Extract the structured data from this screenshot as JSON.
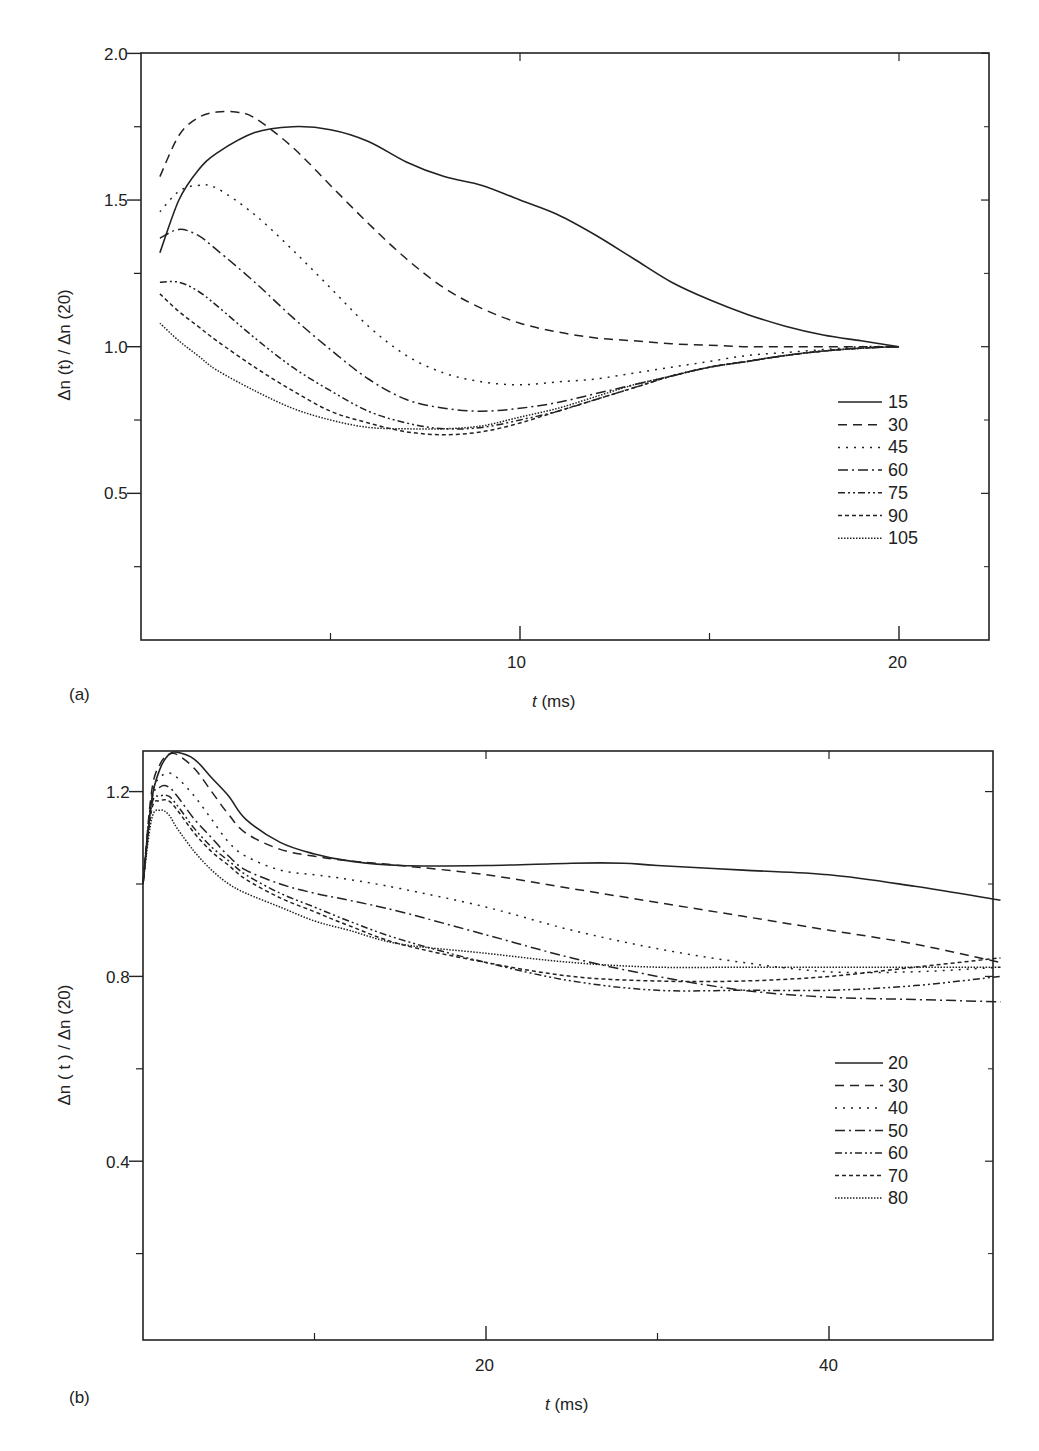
{
  "chart_data": [
    {
      "panel": "(a)",
      "type": "line",
      "xlabel": "t (ms)",
      "ylabel": "Δn (t) / Δn (20)",
      "xlim": [
        0,
        22.5
      ],
      "ylim": [
        0,
        2.0
      ],
      "xticks": [
        10,
        20
      ],
      "xminor": [
        5,
        15
      ],
      "yticks": [
        0.5,
        1.0,
        1.5,
        2.0
      ],
      "yminor": [
        0.25,
        0.75,
        1.25,
        1.75
      ],
      "legend_position": "right-middle",
      "series": [
        {
          "name": "15",
          "style": "solid",
          "x": [
            0.5,
            1,
            1.5,
            2,
            3,
            4,
            5,
            6,
            7,
            8,
            9,
            10,
            11,
            12,
            13,
            14,
            15,
            16,
            17,
            18,
            19,
            20
          ],
          "values": [
            1.32,
            1.5,
            1.6,
            1.66,
            1.73,
            1.75,
            1.74,
            1.7,
            1.63,
            1.58,
            1.55,
            1.5,
            1.45,
            1.38,
            1.3,
            1.22,
            1.16,
            1.11,
            1.07,
            1.04,
            1.02,
            1.0
          ]
        },
        {
          "name": "30",
          "style": "dashed",
          "x": [
            0.5,
            1,
            1.5,
            2,
            2.5,
            3,
            4,
            5,
            6,
            7,
            8,
            9,
            10,
            11,
            12,
            13,
            14,
            15,
            16,
            17,
            18,
            19,
            20
          ],
          "values": [
            1.58,
            1.72,
            1.78,
            1.8,
            1.8,
            1.78,
            1.68,
            1.55,
            1.42,
            1.3,
            1.2,
            1.13,
            1.08,
            1.05,
            1.03,
            1.02,
            1.01,
            1.005,
            1.0,
            1.0,
            1.0,
            1.0,
            1.0
          ]
        },
        {
          "name": "45",
          "style": "dotted",
          "x": [
            0.5,
            1,
            1.5,
            2,
            3,
            4,
            5,
            6,
            7,
            8,
            9,
            10,
            11,
            12,
            13,
            14,
            15,
            16,
            17,
            18,
            19,
            20
          ],
          "values": [
            1.46,
            1.53,
            1.55,
            1.54,
            1.45,
            1.33,
            1.2,
            1.07,
            0.97,
            0.91,
            0.88,
            0.87,
            0.88,
            0.89,
            0.91,
            0.93,
            0.95,
            0.97,
            0.98,
            0.99,
            1.0,
            1.0
          ]
        },
        {
          "name": "60",
          "style": "dashdot",
          "x": [
            0.5,
            1,
            1.5,
            2,
            3,
            4,
            5,
            6,
            7,
            8,
            9,
            10,
            11,
            12,
            13,
            14,
            15,
            16,
            17,
            18,
            19,
            20
          ],
          "values": [
            1.37,
            1.4,
            1.38,
            1.33,
            1.22,
            1.1,
            0.99,
            0.89,
            0.82,
            0.79,
            0.78,
            0.79,
            0.81,
            0.84,
            0.87,
            0.9,
            0.93,
            0.95,
            0.97,
            0.985,
            0.995,
            1.0
          ]
        },
        {
          "name": "75",
          "style": "dashdotdot",
          "x": [
            0.5,
            1,
            1.5,
            2,
            3,
            4,
            5,
            6,
            7,
            8,
            9,
            10,
            11,
            12,
            13,
            14,
            15,
            16,
            17,
            18,
            19,
            20
          ],
          "values": [
            1.22,
            1.22,
            1.19,
            1.14,
            1.03,
            0.93,
            0.85,
            0.78,
            0.74,
            0.72,
            0.725,
            0.75,
            0.78,
            0.82,
            0.86,
            0.9,
            0.93,
            0.95,
            0.97,
            0.985,
            0.995,
            1.0
          ]
        },
        {
          "name": "90",
          "style": "shortdash",
          "x": [
            0.5,
            1,
            1.5,
            2,
            3,
            4,
            5,
            6,
            7,
            8,
            9,
            10,
            11,
            12,
            13,
            14,
            15,
            16,
            17,
            18,
            19,
            20
          ],
          "values": [
            1.18,
            1.12,
            1.07,
            1.02,
            0.93,
            0.85,
            0.78,
            0.74,
            0.71,
            0.7,
            0.71,
            0.74,
            0.78,
            0.82,
            0.86,
            0.9,
            0.93,
            0.95,
            0.97,
            0.985,
            0.995,
            1.0
          ]
        },
        {
          "name": "105",
          "style": "finedot",
          "x": [
            0.5,
            1,
            1.5,
            2,
            3,
            4,
            5,
            6,
            7,
            8,
            9,
            10,
            11,
            12,
            13,
            14,
            15,
            16,
            17,
            18,
            19,
            20
          ],
          "values": [
            1.08,
            1.02,
            0.97,
            0.92,
            0.85,
            0.79,
            0.75,
            0.725,
            0.72,
            0.72,
            0.73,
            0.76,
            0.79,
            0.83,
            0.87,
            0.9,
            0.93,
            0.95,
            0.97,
            0.985,
            0.995,
            1.0
          ]
        }
      ]
    },
    {
      "panel": "(b)",
      "type": "line",
      "xlabel": "t (ms)",
      "ylabel": "Δn ( t ) / Δn (20)",
      "xlim": [
        0,
        50
      ],
      "ylim": [
        0,
        1.3
      ],
      "xticks": [
        20,
        40
      ],
      "xminor": [
        10,
        30
      ],
      "yticks": [
        0.4,
        0.8,
        1.2
      ],
      "yminor": [
        0.2,
        0.6,
        1.0
      ],
      "legend_position": "right-middle",
      "series": [
        {
          "name": "20",
          "style": "solid",
          "x": [
            0,
            0.5,
            1,
            1.5,
            2,
            3,
            4,
            5,
            6,
            8,
            10,
            12,
            15,
            20,
            25,
            28,
            30,
            35,
            40,
            45,
            50
          ],
          "values": [
            1.0,
            1.18,
            1.25,
            1.28,
            1.285,
            1.27,
            1.23,
            1.19,
            1.14,
            1.09,
            1.065,
            1.05,
            1.04,
            1.04,
            1.045,
            1.045,
            1.04,
            1.03,
            1.02,
            0.995,
            0.965
          ]
        },
        {
          "name": "30",
          "style": "dashed",
          "x": [
            0,
            0.5,
            1,
            1.5,
            2,
            3,
            4,
            5,
            6,
            8,
            10,
            12,
            15,
            20,
            25,
            30,
            35,
            40,
            45,
            50
          ],
          "values": [
            1.0,
            1.2,
            1.26,
            1.28,
            1.28,
            1.25,
            1.2,
            1.15,
            1.11,
            1.075,
            1.06,
            1.05,
            1.04,
            1.02,
            0.99,
            0.96,
            0.93,
            0.9,
            0.87,
            0.83
          ]
        },
        {
          "name": "40",
          "style": "dotted",
          "x": [
            0,
            0.5,
            1,
            1.5,
            2,
            3,
            4,
            5,
            6,
            8,
            10,
            12,
            15,
            20,
            25,
            30,
            35,
            40,
            45,
            50
          ],
          "values": [
            1.0,
            1.19,
            1.23,
            1.24,
            1.23,
            1.19,
            1.14,
            1.09,
            1.06,
            1.03,
            1.02,
            1.01,
            0.99,
            0.95,
            0.9,
            0.86,
            0.83,
            0.81,
            0.81,
            0.82
          ]
        },
        {
          "name": "50",
          "style": "dashdot",
          "x": [
            0,
            0.5,
            1,
            1.5,
            2,
            3,
            4,
            5,
            6,
            8,
            10,
            12,
            15,
            20,
            25,
            30,
            35,
            40,
            45,
            50
          ],
          "values": [
            1.0,
            1.18,
            1.21,
            1.21,
            1.19,
            1.14,
            1.1,
            1.06,
            1.03,
            1.0,
            0.98,
            0.965,
            0.94,
            0.89,
            0.84,
            0.8,
            0.77,
            0.755,
            0.75,
            0.745
          ]
        },
        {
          "name": "60",
          "style": "dashdotdot",
          "x": [
            0,
            0.5,
            1,
            1.5,
            2,
            3,
            4,
            5,
            6,
            8,
            10,
            12,
            15,
            20,
            25,
            30,
            35,
            40,
            45,
            50
          ],
          "values": [
            1.0,
            1.17,
            1.19,
            1.19,
            1.17,
            1.12,
            1.08,
            1.05,
            1.02,
            0.98,
            0.95,
            0.92,
            0.88,
            0.83,
            0.79,
            0.77,
            0.77,
            0.77,
            0.78,
            0.8
          ]
        },
        {
          "name": "70",
          "style": "shortdash",
          "x": [
            0,
            0.5,
            1,
            1.5,
            2,
            3,
            4,
            5,
            6,
            8,
            10,
            12,
            15,
            20,
            25,
            30,
            35,
            40,
            45,
            50
          ],
          "values": [
            1.0,
            1.16,
            1.18,
            1.18,
            1.16,
            1.11,
            1.07,
            1.04,
            1.01,
            0.97,
            0.94,
            0.91,
            0.87,
            0.83,
            0.8,
            0.79,
            0.79,
            0.8,
            0.82,
            0.84
          ]
        },
        {
          "name": "80",
          "style": "finedot",
          "x": [
            0,
            0.5,
            1,
            1.5,
            2,
            3,
            4,
            5,
            6,
            8,
            10,
            12,
            15,
            20,
            25,
            30,
            35,
            40,
            45,
            50
          ],
          "values": [
            1.0,
            1.14,
            1.16,
            1.15,
            1.12,
            1.07,
            1.03,
            1.0,
            0.98,
            0.95,
            0.92,
            0.9,
            0.87,
            0.85,
            0.83,
            0.82,
            0.82,
            0.82,
            0.82,
            0.82
          ]
        }
      ]
    }
  ],
  "panels": [
    {
      "label": "(a)",
      "xlabel_italic": "t",
      "xlabel_unit": " (ms)",
      "ylabel": "Δn (t) / Δn (20)",
      "xtick_labels": [
        "10",
        "20"
      ],
      "ytick_labels": [
        "0.5",
        "1.0",
        "1.5",
        "2.0"
      ],
      "legend": [
        "15",
        "30",
        "45",
        "60",
        "75",
        "90",
        "105"
      ]
    },
    {
      "label": "(b)",
      "xlabel_italic": "t",
      "xlabel_unit": " (ms)",
      "ylabel": "Δn ( t ) / Δn (20)",
      "xtick_labels": [
        "20",
        "40"
      ],
      "ytick_labels": [
        "0.4",
        "0.8",
        "1.2"
      ],
      "legend": [
        "20",
        "30",
        "40",
        "50",
        "60",
        "70",
        "80"
      ]
    }
  ],
  "colors": {
    "ink": "#222222",
    "background": "#ffffff"
  }
}
